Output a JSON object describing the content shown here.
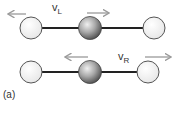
{
  "diagram": {
    "panel_label": "(a)",
    "top_row": {
      "velocity_label": "v",
      "velocity_subscript": "L",
      "description": "Left atom moves left, central atom moves right"
    },
    "bottom_row": {
      "velocity_label": "v",
      "velocity_subscript": "R",
      "description": "Central atom moves left, right atom moves right"
    },
    "colors": {
      "bond": "#222222",
      "outer_atom_fill": "#f4f4f4",
      "outer_atom_stroke": "#555555",
      "center_atom_light": "#dddddd",
      "center_atom_dark": "#555555",
      "arrow": "#9a9a9a"
    }
  }
}
